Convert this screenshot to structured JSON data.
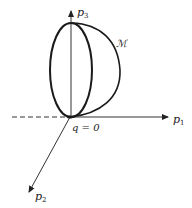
{
  "diagram": {
    "axes": {
      "p1": {
        "label": "p",
        "subscript": "1"
      },
      "p2": {
        "label": "p",
        "subscript": "2"
      },
      "p3": {
        "label": "p",
        "subscript": "3"
      }
    },
    "origin_label": "q = 0",
    "surface_label": "ℳ",
    "colors": {
      "stroke": "#1a1a1a",
      "axis": "#333333",
      "background": "#ffffff"
    }
  }
}
